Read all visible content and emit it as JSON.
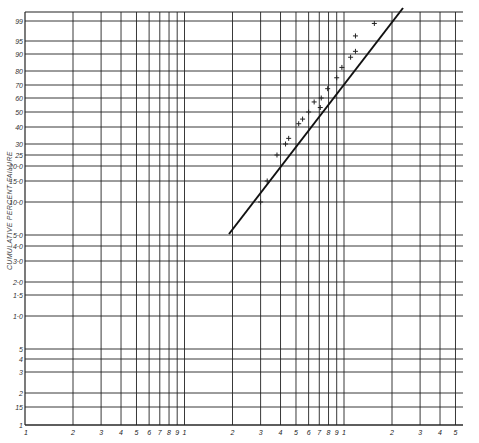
{
  "chart_data": {
    "type": "scatter",
    "title": "",
    "xlabel": "",
    "ylabel": "CUMULATIVE PERCENT FAILURE",
    "x_scale": "log",
    "y_scale": "probability (normal)",
    "xlim": [
      1,
      500
    ],
    "ylim": [
      0.1,
      99.9
    ],
    "grid": true,
    "legend": null,
    "y_ticks": [
      "99.9",
      "99",
      "95",
      "90",
      "80",
      "70",
      "60",
      "50",
      "40",
      "30",
      "25",
      "20.0",
      "15.0",
      "10.0",
      "5.0",
      "4.0",
      "3.0",
      "2.0",
      "1.5",
      "1.0",
      ".5",
      ".4",
      ".3",
      ".2",
      ".15",
      ".1"
    ],
    "y_tick_labels_shown": [
      "99",
      "95",
      "90",
      "80",
      "70",
      "60",
      "50",
      "40",
      "30",
      "25",
      "20·0",
      "15·0",
      "10·0",
      "5·0",
      "4·0",
      "3·0",
      "2·0",
      "1·5",
      "1·0",
      "5",
      "4",
      "3",
      "2",
      "15",
      "1"
    ],
    "x_tick_labels": [
      "1",
      "2",
      "3",
      "4",
      "5",
      "6",
      "7",
      "8",
      "9",
      "1",
      "2",
      "3",
      "4",
      "5",
      "6",
      "7",
      "8",
      "9",
      "1",
      "2",
      "3",
      "4",
      "5"
    ],
    "x_ticks": [
      1,
      2,
      3,
      4,
      5,
      6,
      7,
      8,
      9,
      10,
      20,
      30,
      40,
      50,
      60,
      70,
      80,
      90,
      100,
      200,
      300,
      400,
      500
    ],
    "series": [
      {
        "name": "observed failures",
        "marker": "+",
        "x": [
          30,
          33,
          38,
          43,
          45,
          52,
          55,
          60,
          65,
          71,
          72,
          79,
          90,
          97,
          110,
          118,
          118,
          155
        ],
        "y": [
          10,
          15,
          25,
          30,
          33,
          42,
          45,
          50,
          57,
          53,
          60,
          67,
          75,
          82,
          88,
          91,
          96,
          98.5
        ]
      },
      {
        "name": "fitted line",
        "type": "line",
        "x": [
          17,
          200
        ],
        "y": [
          5,
          99.9
        ]
      }
    ]
  }
}
